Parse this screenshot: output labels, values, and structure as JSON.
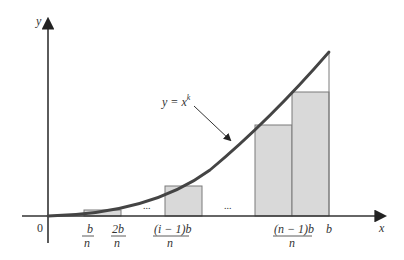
{
  "figure": {
    "axes": {
      "x_label": "x",
      "y_label": "y",
      "origin_label": "0"
    },
    "curve_label": {
      "base": "y = x",
      "exponent": "k"
    },
    "ellipsis": "...",
    "tick_labels": [
      {
        "num": "b",
        "den": "n"
      },
      {
        "num": "2b",
        "den": "n"
      },
      {
        "num": "(i − 1)b",
        "den": "n"
      },
      {
        "num": "(n − 1)b",
        "den": "n"
      },
      {
        "single": "b"
      }
    ],
    "colors": {
      "curve": "#444444",
      "axis": "#333333",
      "rect_fill": "#d9d9d9",
      "rect_stroke": "#777777"
    }
  }
}
